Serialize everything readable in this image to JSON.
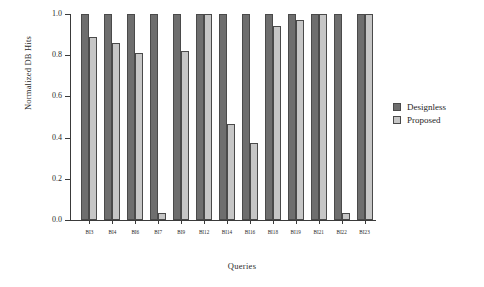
{
  "chart_data": {
    "type": "bar",
    "title": "",
    "xlabel": "Queries",
    "ylabel": "Normalized DB Hits",
    "categories": [
      "BI3",
      "BI4",
      "BI6",
      "BI7",
      "BI9",
      "BI12",
      "BI14",
      "BI16",
      "BI18",
      "BI19",
      "BI21",
      "BI22",
      "BI23"
    ],
    "series": [
      {
        "name": "Designless",
        "color": "#6e6e6e",
        "values": [
          1.0,
          1.0,
          1.0,
          1.0,
          1.0,
          1.0,
          1.0,
          1.0,
          1.0,
          1.0,
          1.0,
          1.0,
          1.0
        ]
      },
      {
        "name": "Proposed",
        "color": "#c6c6c6",
        "values": [
          0.89,
          0.86,
          0.81,
          0.035,
          0.82,
          1.0,
          0.465,
          0.375,
          0.94,
          0.97,
          1.0,
          0.035,
          1.0
        ]
      }
    ],
    "ylim": [
      0.0,
      1.0
    ],
    "yticks": [
      0.0,
      0.2,
      0.4,
      0.6,
      0.8,
      1.0
    ],
    "ytick_labels": [
      "0.0",
      "0.2",
      "0.4",
      "0.6",
      "0.8",
      "1.0"
    ],
    "grid": false,
    "legend_position": "right"
  },
  "legend": {
    "entries": [
      {
        "label": "Designless"
      },
      {
        "label": "Proposed"
      }
    ]
  }
}
